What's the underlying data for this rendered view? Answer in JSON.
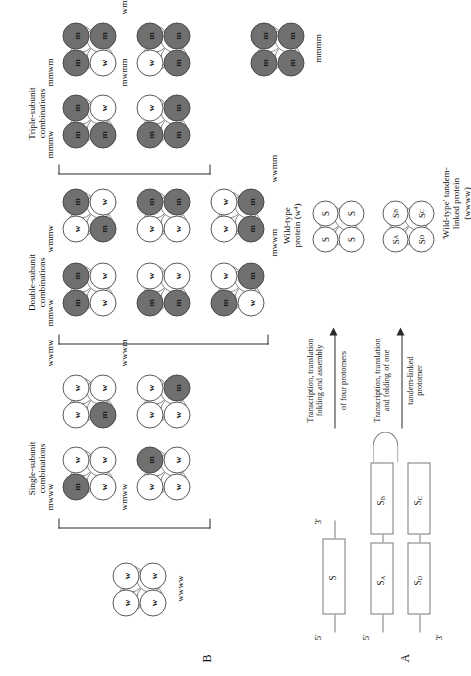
{
  "figure": {
    "panels": [
      {
        "id": "A",
        "label": "A"
      },
      {
        "id": "B",
        "label": "B"
      }
    ]
  },
  "panel_a": {
    "gene_single": {
      "five_prime": "5'",
      "three_prime": "3'",
      "gene_label": "S"
    },
    "gene_tandem": {
      "five_prime": "5'",
      "three_prime": "3'",
      "genes_top": [
        "S",
        "S"
      ],
      "genes_bottom": [
        "S",
        "S"
      ],
      "subscripts_top": [
        "A",
        "B"
      ],
      "subscripts_bottom": [
        "D",
        "C"
      ]
    },
    "arrow_top": {
      "line1": "Transcription, translation",
      "line2": "folding and assembly",
      "line3": "of four protomers"
    },
    "arrow_bottom": {
      "line1": "Transcription, translation",
      "line2": "and folding of one",
      "line3": "tandem-linked",
      "line4": "protomer"
    },
    "protein_wildtype": {
      "caption_line1": "Wild-type",
      "caption_line2": "protein (w",
      "caption_sup": "4",
      "caption_line2_end": ")",
      "subunit_letters": [
        "S",
        "S",
        "S",
        "S"
      ]
    },
    "protein_tandem": {
      "caption_line1": "'Wild-type' tandem-",
      "caption_line2": "linked protein",
      "caption_line3": "(wwww)",
      "subunit_letters": [
        "S",
        "S",
        "S",
        "S"
      ],
      "subunit_subscripts": [
        "A",
        "B",
        "D",
        "C"
      ]
    }
  },
  "panel_b": {
    "groups": [
      {
        "heading_line1": "Single-subunit",
        "heading_line2": "combinations"
      },
      {
        "heading_line1": "Double-subunit",
        "heading_line2": "combinations"
      },
      {
        "heading_line1": "Triple-subunit",
        "heading_line2": "combinations"
      }
    ],
    "wildtype_tetramer": {
      "genotype": "wwww",
      "subunits": [
        "w",
        "w",
        "w",
        "w"
      ]
    },
    "mutant_tetramer": {
      "genotype": "mmmm",
      "subunits": [
        "m",
        "m",
        "m",
        "m"
      ]
    },
    "single_subunit": [
      {
        "genotype": "mwww",
        "subunits": [
          "m",
          "w",
          "w",
          "w"
        ]
      },
      {
        "genotype": "wmww",
        "subunits": [
          "w",
          "m",
          "w",
          "w"
        ]
      },
      {
        "genotype": "wwmw",
        "subunits": [
          "w",
          "w",
          "m",
          "w"
        ]
      },
      {
        "genotype": "wwwm",
        "subunits": [
          "w",
          "w",
          "w",
          "m"
        ]
      }
    ],
    "double_subunit": [
      {
        "genotype": "mmww",
        "subunits": [
          "m",
          "m",
          "w",
          "w"
        ]
      },
      {
        "genotype": "wmmw",
        "subunits": [
          "w",
          "m",
          "m",
          "w"
        ]
      },
      {
        "genotype": "mwmw",
        "subunits": [
          "m",
          "w",
          "m",
          "w"
        ]
      },
      {
        "genotype": "mwwm",
        "subunits": [
          "m",
          "w",
          "w",
          "m"
        ]
      },
      {
        "genotype": "wmwm",
        "subunits": [
          "w",
          "m",
          "w",
          "m"
        ]
      },
      {
        "genotype": "wwmm",
        "subunits": [
          "w",
          "w",
          "m",
          "m"
        ]
      }
    ],
    "triple_subunit": [
      {
        "genotype": "mmmw",
        "subunits": [
          "m",
          "m",
          "m",
          "w"
        ]
      },
      {
        "genotype": "mmwm",
        "subunits": [
          "m",
          "m",
          "w",
          "m"
        ]
      },
      {
        "genotype": "mwmm",
        "subunits": [
          "m",
          "w",
          "m",
          "m"
        ]
      },
      {
        "genotype": "wmmm",
        "subunits": [
          "w",
          "m",
          "m",
          "m"
        ]
      }
    ],
    "subunit_glyphs": {
      "wildtype": "w",
      "mutant": "m"
    }
  },
  "colors": {
    "mutant_fill": "#707070",
    "wildtype_fill": "#ffffff",
    "outline": "#5a5a5a",
    "text": "#111111",
    "gene_outline": "#7b7b7b"
  }
}
